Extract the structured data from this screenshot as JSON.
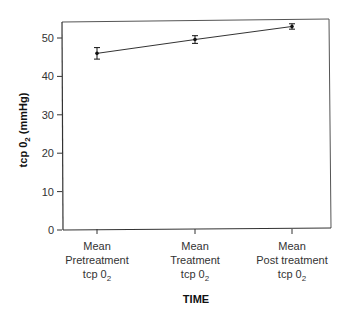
{
  "chart_data": {
    "type": "line",
    "title": "",
    "xlabel": "TIME",
    "ylabel": "tcp 0₂ (mmHg)",
    "ylim": [
      0,
      55
    ],
    "yticks": [
      0,
      10,
      20,
      30,
      40,
      50
    ],
    "grid": false,
    "legend": null,
    "categories": [
      "Mean Pretreatment tcp 0₂",
      "Mean Treatment tcp 0₂",
      "Mean Post treatment tcp 0₂"
    ],
    "category_lines": [
      [
        "Mean",
        "Pretreatment",
        "tcp 0₂"
      ],
      [
        "Mean",
        "Treatment",
        "tcp 0₂"
      ],
      [
        "Mean",
        "Post treatment",
        "tcp 0₂"
      ]
    ],
    "series": [
      {
        "name": "tcp 0₂",
        "values": [
          46,
          49.6,
          53
        ],
        "error": [
          1.5,
          1.0,
          0.7
        ]
      }
    ]
  },
  "axis": {
    "y_title_main": "tcp 0",
    "y_title_sub": "2",
    "y_title_unit": " (mmHg)",
    "x_title": "TIME"
  }
}
